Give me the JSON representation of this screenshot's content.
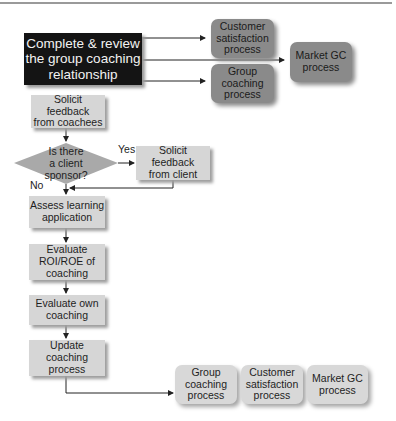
{
  "diagram": {
    "type": "flowchart",
    "start_node": {
      "lines": [
        "Complete & review",
        "the group coaching",
        "relationship"
      ]
    },
    "top_targets": [
      {
        "id": "customer-satisfaction-top",
        "lines": [
          "Customer",
          "satisfaction",
          "process"
        ]
      },
      {
        "id": "group-coaching-top",
        "lines": [
          "Group",
          "coaching",
          "process"
        ]
      },
      {
        "id": "market-gc-top",
        "lines": [
          "Market GC",
          "process"
        ]
      }
    ],
    "steps": [
      {
        "id": "solicit-coachees",
        "lines": [
          "Solicit",
          "feedback",
          "from coachees"
        ]
      },
      {
        "id": "decision-client-sponsor",
        "lines": [
          "Is there",
          "a client",
          "sponsor?"
        ]
      },
      {
        "id": "solicit-client",
        "lines": [
          "Solicit",
          "feedback",
          "from client"
        ]
      },
      {
        "id": "assess-learning",
        "lines": [
          "Assess learning",
          "application"
        ]
      },
      {
        "id": "evaluate-roi",
        "lines": [
          "Evaluate",
          "ROI/ROE of",
          "coaching"
        ]
      },
      {
        "id": "evaluate-own",
        "lines": [
          "Evaluate own",
          "coaching"
        ]
      },
      {
        "id": "update-process",
        "lines": [
          "Update",
          "coaching",
          "process"
        ]
      }
    ],
    "decision_labels": {
      "yes": "Yes",
      "no": "No"
    },
    "bottom_targets": [
      {
        "id": "group-coaching-bottom",
        "lines": [
          "Group",
          "coaching",
          "process"
        ]
      },
      {
        "id": "customer-satisfaction-bottom",
        "lines": [
          "Customer",
          "satisfaction",
          "process"
        ]
      },
      {
        "id": "market-gc-bottom",
        "lines": [
          "Market GC",
          "process"
        ]
      }
    ],
    "colors": {
      "start_fill": "#141414",
      "step_fill": "#d6d6d6",
      "top_target_fill": "#8a8a8a",
      "bottom_target_fill": "#d8d8d8",
      "connector": "#222222"
    }
  }
}
